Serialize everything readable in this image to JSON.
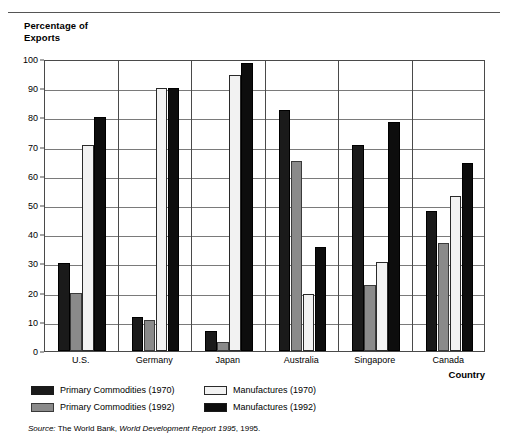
{
  "chart_data": {
    "type": "bar",
    "title": "Percentage of\nExports",
    "ylabel": "Percentage of Exports",
    "xlabel": "Country",
    "categories": [
      "U.S.",
      "Germany",
      "Japan",
      "Australia",
      "Singapore",
      "Canada"
    ],
    "ylim": [
      0,
      100
    ],
    "yticks": [
      0,
      10,
      20,
      30,
      40,
      50,
      60,
      70,
      80,
      90,
      100
    ],
    "grid": true,
    "legend_position": "below-plot",
    "series": [
      {
        "name": "Primary Commodities (1970)",
        "color": "#1a1a1a",
        "values": [
          30,
          11.5,
          7,
          82.5,
          70.5,
          48
        ]
      },
      {
        "name": "Primary Commodities (1992)",
        "color": "#8a8a8a",
        "values": [
          20,
          10.5,
          3,
          65,
          22.5,
          37
        ]
      },
      {
        "name": "Manufactures (1970)",
        "color": "#f2f2f2",
        "values": [
          70.5,
          90,
          94.5,
          19.5,
          30.5,
          53
        ]
      },
      {
        "name": "Manufactures (1992)",
        "color": "#0d0d0d",
        "values": [
          80,
          90,
          98.5,
          35.5,
          78.5,
          64.5
        ]
      }
    ],
    "source": {
      "prefix": "Source:",
      "publisher": " The World Bank, ",
      "report": "World Development Report 1995",
      "suffix": ", 1995."
    }
  },
  "legend": {
    "items": [
      {
        "label": "Primary Commodities (1970)",
        "swatch": "dark"
      },
      {
        "label": "Manufactures (1970)",
        "swatch": "white"
      },
      {
        "label": "Primary Commodities (1992)",
        "swatch": "gray"
      },
      {
        "label": "Manufactures (1992)",
        "swatch": "black"
      }
    ]
  }
}
